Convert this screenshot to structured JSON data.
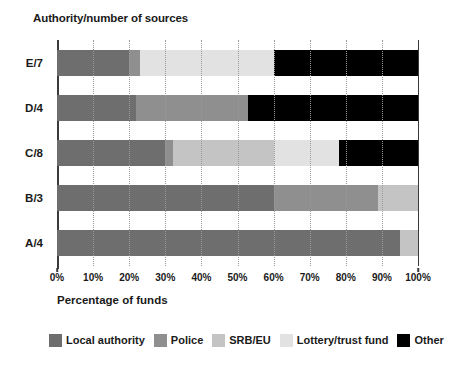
{
  "chart_data": {
    "type": "bar",
    "orientation": "horizontal",
    "stacked": true,
    "title": "",
    "ylabel": "Authority/number of sources",
    "xlabel": "Percentage of funds",
    "xlim": [
      0,
      100
    ],
    "xticks": [
      0,
      10,
      20,
      30,
      40,
      50,
      60,
      70,
      80,
      90,
      100
    ],
    "xtick_labels": [
      "0%",
      "10%",
      "20%",
      "30%",
      "40%",
      "50%",
      "60%",
      "70%",
      "80%",
      "90%",
      "100%"
    ],
    "grid": "vertical-dotted",
    "legend_position": "bottom",
    "categories": [
      "E/7",
      "D/4",
      "C/8",
      "B/3",
      "A/4"
    ],
    "series": [
      {
        "name": "Local authority",
        "color": "#6e6e6e",
        "values": [
          20,
          22,
          30,
          60,
          95
        ]
      },
      {
        "name": "Police",
        "color": "#8f8f8f",
        "values": [
          3,
          31,
          2,
          29,
          0
        ]
      },
      {
        "name": "SRB/EU",
        "color": "#c4c4c4",
        "values": [
          0,
          0,
          28,
          11,
          5
        ]
      },
      {
        "name": "Lottery/trust fund",
        "color": "#e2e2e2",
        "values": [
          37,
          0,
          18,
          0,
          0
        ]
      },
      {
        "name": "Other",
        "color": "#000000",
        "values": [
          40,
          47,
          22,
          0,
          0
        ]
      }
    ]
  },
  "legend": {
    "items": [
      {
        "label": "Local authority",
        "swatch": "#6e6e6e"
      },
      {
        "label": "Police",
        "swatch": "#8f8f8f"
      },
      {
        "label": "SRB/EU",
        "swatch": "#c4c4c4"
      },
      {
        "label": "Lottery/trust fund",
        "swatch": "#e2e2e2"
      },
      {
        "label": "Other",
        "swatch": "#000000"
      }
    ]
  },
  "colors": {
    "axis": "#3a3a3a",
    "gridline": "#9a9a9a",
    "background": "#ffffff",
    "text": "#1a1a1a"
  }
}
